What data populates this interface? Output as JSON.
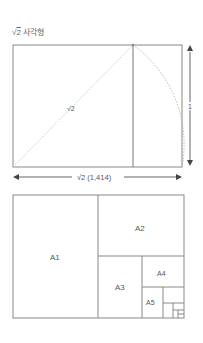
{
  "title": {
    "radical": "√",
    "radicand": "2",
    "text": " 사각형"
  },
  "diagram1": {
    "diagonal_label": "√2",
    "height_label": "1",
    "width_label": "√2  (1,414)"
  },
  "diagram2": {
    "labels": [
      "A1",
      "A2",
      "A3",
      "A4",
      "A5"
    ]
  },
  "colors": {
    "line": "#888888",
    "dashed": "#aaaaaa",
    "arrow": "#555555"
  }
}
